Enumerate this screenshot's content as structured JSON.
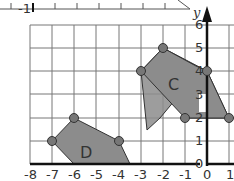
{
  "diagram": {
    "type": "coordinate-grid",
    "x_axis": {
      "ticks": [
        "-8",
        "-7",
        "-6",
        "-5",
        "-4",
        "-3",
        "-2",
        "-1",
        "0",
        "1"
      ],
      "min": -8,
      "max": 1
    },
    "y_axis": {
      "label": "y",
      "ticks": [
        "0",
        "1",
        "2",
        "3",
        "4",
        "5",
        "6"
      ],
      "min": 0,
      "max": 6
    },
    "top_ruler": {
      "visible_label": "-1",
      "partial_label": "0"
    },
    "shapes": [
      {
        "label": "C",
        "vertices": [
          [
            -3,
            4
          ],
          [
            -2,
            5
          ],
          [
            0,
            4
          ],
          [
            1,
            2
          ],
          [
            -1,
            2
          ]
        ],
        "fill": "#8c8c8c"
      },
      {
        "label": "D",
        "vertices": [
          [
            -7,
            1
          ],
          [
            -6,
            2
          ],
          [
            -4,
            1
          ],
          [
            -3.5,
            0
          ],
          [
            -6,
            0
          ]
        ],
        "fill": "#8c8c8c"
      }
    ],
    "colors": {
      "grid": "#777777",
      "axis": "#111111",
      "shape_fill": "#8c8c8c",
      "vertex": "#777777"
    }
  }
}
